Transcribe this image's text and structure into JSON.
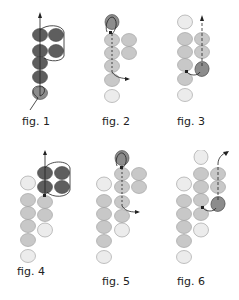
{
  "colors": {
    "dark_bead": "#5e5e5e",
    "mid_bead": "#8c8c8c",
    "light_bead": "#c8c8c8",
    "pale_bead": "#ececec",
    "thread": "#222222",
    "outline": "#777777"
  },
  "figures": [
    {
      "id": 1,
      "label": "fig. 1"
    },
    {
      "id": 2,
      "label": "fig. 2"
    },
    {
      "id": 3,
      "label": "fig. 3"
    },
    {
      "id": 4,
      "label": "fig. 4"
    },
    {
      "id": 5,
      "label": "fig. 5"
    },
    {
      "id": 6,
      "label": "fig. 6"
    }
  ]
}
